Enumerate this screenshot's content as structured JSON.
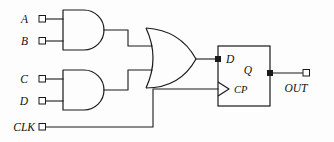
{
  "diagram": {
    "background_color": "#fdfdfd",
    "line_color": "#1a1a1a",
    "inputs": [
      {
        "id": "a",
        "label": "A",
        "x": 30,
        "y": 19
      },
      {
        "id": "b",
        "label": "B",
        "x": 30,
        "y": 41
      },
      {
        "id": "c",
        "label": "C",
        "x": 30,
        "y": 79
      },
      {
        "id": "d",
        "label": "D",
        "x": 30,
        "y": 101
      },
      {
        "id": "clk",
        "label": "CLK",
        "x": 30,
        "y": 127
      }
    ],
    "outputs": [
      {
        "id": "out",
        "label": "OUT",
        "x": 300,
        "y": 73
      }
    ],
    "gates": [
      {
        "id": "and1",
        "type": "AND",
        "inputs": [
          "A",
          "B"
        ],
        "output_to": "or1"
      },
      {
        "id": "and2",
        "type": "AND",
        "inputs": [
          "C",
          "D"
        ],
        "output_to": "or1"
      },
      {
        "id": "or1",
        "type": "OR",
        "inputs": [
          "and1",
          "and2"
        ],
        "output_to": "ff1.D"
      }
    ],
    "flipflop": {
      "id": "ff1",
      "type": "D",
      "pin_d": "D",
      "pin_q": "Q",
      "pin_clock": "CP",
      "clock_edge": "rising",
      "clock_source": "CLK"
    }
  }
}
